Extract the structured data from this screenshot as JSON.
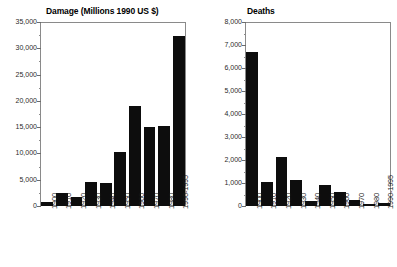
{
  "figure": {
    "background_color": "#ffffff",
    "bar_color": "#0d0d0d",
    "axis_color": "#8a8a8a"
  },
  "chart_data": [
    {
      "type": "bar",
      "title": "Damage (Millions 1990 US $)",
      "xlabel": "",
      "ylabel": "",
      "ylim": [
        0,
        35000
      ],
      "ytick_step": 5000,
      "grid": false,
      "legend": "none",
      "categories": [
        "1900",
        "1910",
        "1920",
        "1930",
        "1940",
        "1950",
        "1960",
        "1970",
        "1980",
        "1990-1995"
      ],
      "values": [
        800,
        2500,
        1700,
        4500,
        4300,
        10200,
        19100,
        15000,
        15300,
        32300
      ],
      "ytick_labels": [
        "0",
        "5,000",
        "10,000",
        "15,000",
        "20,000",
        "25,000",
        "30,000",
        "35,000"
      ],
      "ytick_values": [
        0,
        5000,
        10000,
        15000,
        20000,
        25000,
        30000,
        35000
      ]
    },
    {
      "type": "bar",
      "title": "Deaths",
      "xlabel": "",
      "ylabel": "",
      "ylim": [
        0,
        8000
      ],
      "ytick_step": 1000,
      "grid": false,
      "legend": "none",
      "categories": [
        "1900",
        "1910",
        "1920",
        "1930",
        "1940",
        "1950",
        "1960",
        "1970",
        "1980",
        "1990-1995"
      ],
      "values": [
        6700,
        1050,
        2150,
        1150,
        200,
        900,
        600,
        250,
        100,
        130
      ],
      "ytick_labels": [
        "0",
        "1,000",
        "2,000",
        "3,000",
        "4,000",
        "5,000",
        "6,000",
        "7,000",
        "8,000"
      ],
      "ytick_values": [
        0,
        1000,
        2000,
        3000,
        4000,
        5000,
        6000,
        7000,
        8000
      ]
    }
  ]
}
